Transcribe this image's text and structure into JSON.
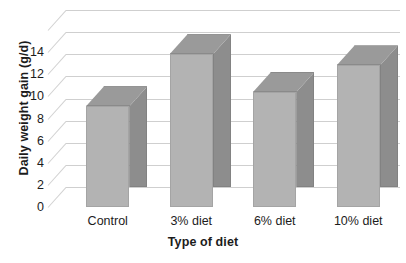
{
  "chart_data": {
    "type": "bar",
    "title": "",
    "xlabel": "Type of diet",
    "ylabel": "Daily weight gain (g/d)",
    "categories": [
      "Control",
      "3% diet",
      "6% diet",
      "10% diet"
    ],
    "values": [
      9.1,
      13.8,
      10.4,
      12.8
    ],
    "series": [
      {
        "name": "Daily weight gain",
        "values": [
          9.1,
          13.8,
          10.4,
          12.8
        ]
      }
    ],
    "ylim": [
      0,
      16
    ],
    "ytick_labels": [
      "0",
      "2",
      "4",
      "6",
      "8",
      "10",
      "12",
      "14"
    ],
    "ytick_values": [
      0,
      2,
      4,
      6,
      8,
      10,
      12,
      14
    ],
    "ytick_step": 2,
    "grid": true,
    "grid_axis": "y",
    "legend": "none",
    "style": "3d-column",
    "colors": {
      "bar_front": "#b3b3b3",
      "bar_side": "#8d8d8d",
      "bar_top": "#9a9a9a",
      "gridline": "#d2d2d2",
      "text": "#1c1c1c",
      "background": "#ffffff"
    }
  }
}
